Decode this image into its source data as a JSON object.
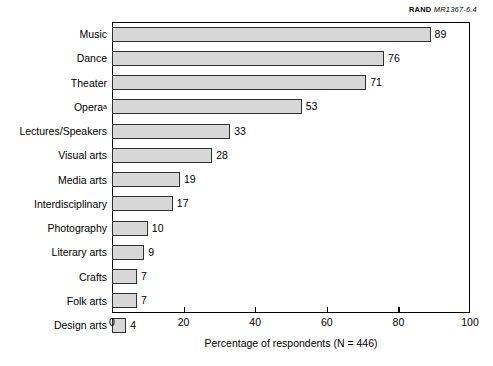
{
  "credit": {
    "organization": "RAND",
    "figure_number": "MR1367-6.4"
  },
  "chart_data": {
    "type": "bar",
    "orientation": "horizontal",
    "title": "",
    "xlabel": "Percentage of respondents (N = 446)",
    "ylabel": "",
    "xlim": [
      0,
      100
    ],
    "xticks": [
      0,
      20,
      40,
      60,
      80,
      100
    ],
    "grid": false,
    "legend": false,
    "bar_color": "#d7d7d7",
    "bar_border_color": "#303030",
    "categories": [
      "Music",
      "Dance",
      "Theater",
      "Opera",
      "Lectures/Speakers",
      "Visual arts",
      "Media arts",
      "Interdisciplinary",
      "Photography",
      "Literary arts",
      "Crafts",
      "Folk arts",
      "Design arts"
    ],
    "values": [
      89,
      76,
      71,
      53,
      33,
      28,
      19,
      17,
      10,
      9,
      7,
      7,
      4
    ],
    "footnote_markers": [
      "",
      "",
      "",
      "a",
      "",
      "",
      "",
      "",
      "",
      "",
      "",
      "",
      ""
    ],
    "bars": [
      {
        "label": "Music",
        "value": 89,
        "footnote": ""
      },
      {
        "label": "Dance",
        "value": 76,
        "footnote": ""
      },
      {
        "label": "Theater",
        "value": 71,
        "footnote": ""
      },
      {
        "label": "Opera",
        "value": 53,
        "footnote": "a"
      },
      {
        "label": "Lectures/Speakers",
        "value": 33,
        "footnote": ""
      },
      {
        "label": "Visual arts",
        "value": 28,
        "footnote": ""
      },
      {
        "label": "Media arts",
        "value": 19,
        "footnote": ""
      },
      {
        "label": "Interdisciplinary",
        "value": 17,
        "footnote": ""
      },
      {
        "label": "Photography",
        "value": 10,
        "footnote": ""
      },
      {
        "label": "Literary arts",
        "value": 9,
        "footnote": ""
      },
      {
        "label": "Crafts",
        "value": 7,
        "footnote": ""
      },
      {
        "label": "Folk arts",
        "value": 7,
        "footnote": ""
      },
      {
        "label": "Design arts",
        "value": 4,
        "footnote": ""
      }
    ]
  }
}
